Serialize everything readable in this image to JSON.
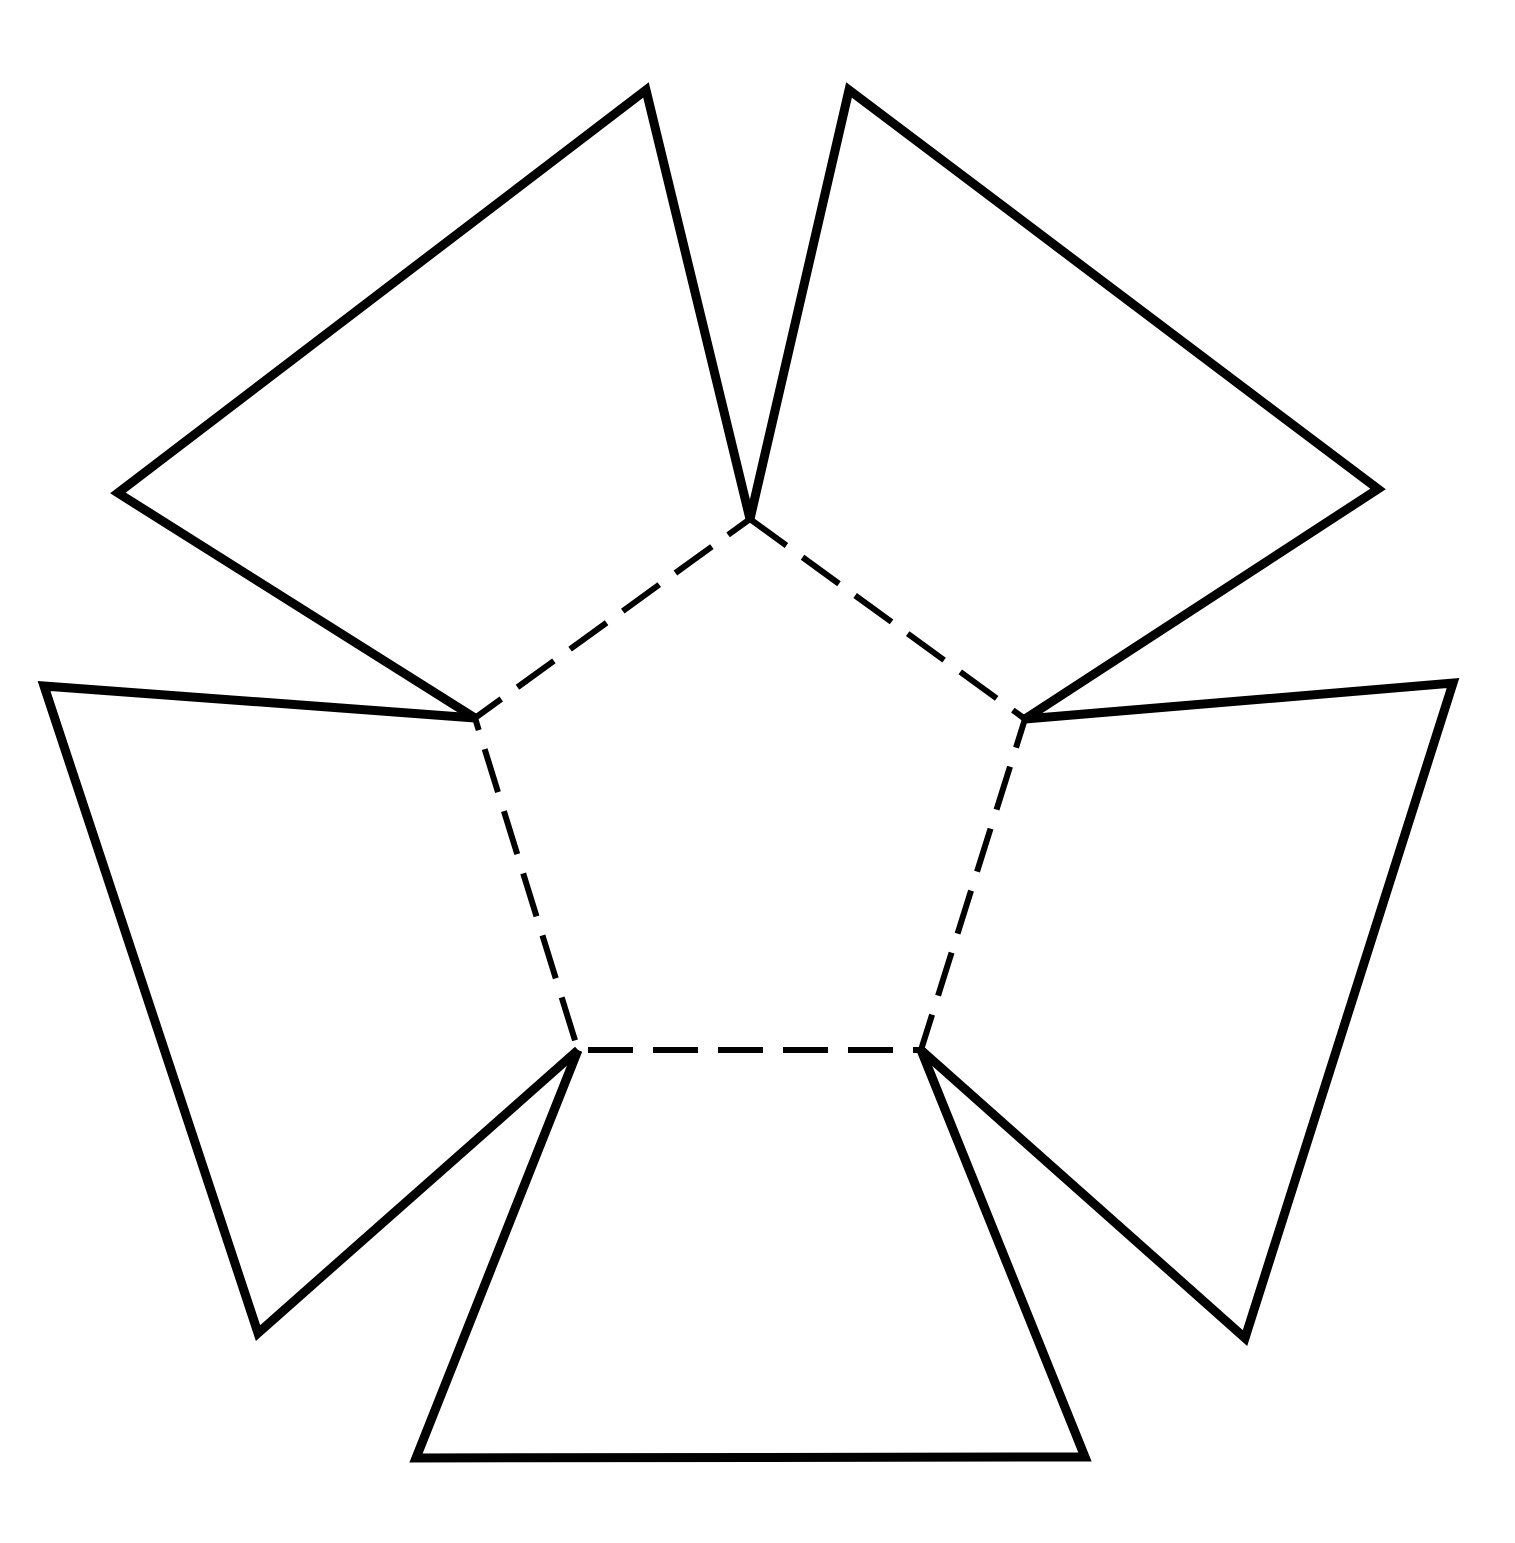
{
  "figure": {
    "kind": "geometric-net-diagram",
    "background_color": "#ffffff",
    "stroke_color": "#000000",
    "canvas": {
      "width": 1515,
      "height": 1543
    }
  },
  "style": {
    "solid_stroke_width": 9,
    "dashed_stroke_width": 6,
    "dash_length": 45,
    "dash_gap": 20,
    "line_cap": "butt",
    "line_join": "miter"
  },
  "geometry": {
    "core_polygon": {
      "name": "central-pentagon",
      "sides": 5,
      "line_style": "dashed",
      "vertices": [
        {
          "label": "P1-top",
          "x": 750,
          "y": 519
        },
        {
          "label": "P2-upper-right",
          "x": 1025,
          "y": 719
        },
        {
          "label": "P3-lower-right",
          "x": 921,
          "y": 1050
        },
        {
          "label": "P4-lower-left",
          "x": 578,
          "y": 1050
        },
        {
          "label": "P5-upper-left",
          "x": 475,
          "y": 718
        }
      ]
    },
    "flaps": [
      {
        "name": "flap-upper-left",
        "line_style": "solid",
        "sides": 4,
        "vertices": [
          {
            "label": "hinge-a",
            "x": 750,
            "y": 519
          },
          {
            "label": "outer-a",
            "x": 646,
            "y": 90
          },
          {
            "label": "outer-b",
            "x": 118,
            "y": 493
          },
          {
            "label": "hinge-b",
            "x": 475,
            "y": 718
          }
        ],
        "hinge_edge": [
          "P5-upper-left",
          "P1-top"
        ]
      },
      {
        "name": "flap-upper-right",
        "line_style": "solid",
        "sides": 4,
        "vertices": [
          {
            "label": "hinge-a",
            "x": 750,
            "y": 519
          },
          {
            "label": "outer-a",
            "x": 849,
            "y": 90
          },
          {
            "label": "outer-b",
            "x": 1378,
            "y": 489
          },
          {
            "label": "hinge-b",
            "x": 1025,
            "y": 719
          }
        ],
        "hinge_edge": [
          "P1-top",
          "P2-upper-right"
        ]
      },
      {
        "name": "flap-left",
        "line_style": "solid",
        "sides": 4,
        "vertices": [
          {
            "label": "hinge-a",
            "x": 475,
            "y": 718
          },
          {
            "label": "outer-a",
            "x": 44,
            "y": 686
          },
          {
            "label": "outer-b",
            "x": 258,
            "y": 1333
          },
          {
            "label": "hinge-b",
            "x": 578,
            "y": 1050
          }
        ],
        "hinge_edge": [
          "P4-lower-left",
          "P5-upper-left"
        ]
      },
      {
        "name": "flap-right",
        "line_style": "solid",
        "sides": 4,
        "vertices": [
          {
            "label": "hinge-a",
            "x": 1025,
            "y": 719
          },
          {
            "label": "outer-a",
            "x": 1453,
            "y": 683
          },
          {
            "label": "outer-b",
            "x": 1245,
            "y": 1338
          },
          {
            "label": "hinge-b",
            "x": 921,
            "y": 1050
          }
        ],
        "hinge_edge": [
          "P2-upper-right",
          "P3-lower-right"
        ]
      },
      {
        "name": "flap-bottom",
        "line_style": "solid",
        "sides": 4,
        "vertices": [
          {
            "label": "hinge-a",
            "x": 578,
            "y": 1050
          },
          {
            "label": "outer-a",
            "x": 416,
            "y": 1458
          },
          {
            "label": "outer-b",
            "x": 1085,
            "y": 1457
          },
          {
            "label": "hinge-b",
            "x": 921,
            "y": 1050
          }
        ],
        "hinge_edge": [
          "P3-lower-right",
          "P4-lower-left"
        ]
      }
    ]
  }
}
